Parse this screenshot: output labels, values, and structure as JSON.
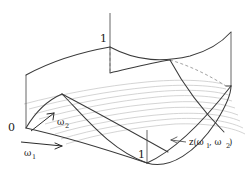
{
  "figure": {
    "name": "surface-plot-z-omega1-omega2",
    "background_color": "#ffffff",
    "colors": {
      "boundary": "#3a3a3a",
      "mesh": "#c9c9c9",
      "axis": "#555555",
      "dashed": "#777777",
      "text": "#1a1a1a",
      "leader": "#4a4a4a"
    },
    "labels": {
      "origin": "0",
      "tick_top": "1",
      "tick_bottom": "1",
      "axis_omega1_base": "ω",
      "axis_omega1_sub": "1",
      "axis_omega2_base": "ω",
      "axis_omega2_sub": "2",
      "function_label": "z(ω",
      "function_sub1": "1",
      "function_mid": ", ω",
      "function_sub2": "2",
      "function_close": ")"
    },
    "mesh": {
      "line_count": 9,
      "orientation": "horizontal-isolines"
    },
    "axes": {
      "vertical_left": true,
      "vertical_mid_top": true,
      "vertical_mid_bottom": true,
      "vertical_right": true,
      "domain_range": [
        0,
        1
      ]
    }
  }
}
